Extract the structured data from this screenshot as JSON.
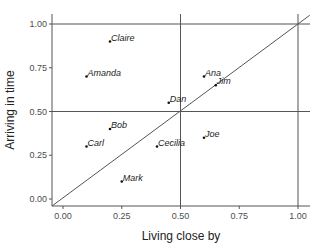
{
  "chart_data": {
    "type": "scatter",
    "title": "",
    "xlabel": "Living close by",
    "ylabel": "Arriving in time",
    "xlim": [
      -0.05,
      1.05
    ],
    "ylim": [
      -0.04,
      1.05
    ],
    "xticks": [
      "0.00",
      "0.25",
      "0.50",
      "0.75",
      "1.00"
    ],
    "yticks": [
      "0.00",
      "0.25",
      "0.50",
      "0.75",
      "1.00"
    ],
    "grid": false,
    "reference_lines": {
      "horizontal": [
        0.5,
        1.0
      ],
      "vertical": [
        0.5,
        1.0
      ],
      "diagonal": "y = x"
    },
    "points": [
      {
        "label": "Claire",
        "x": 0.2,
        "y": 0.9
      },
      {
        "label": "Amanda",
        "x": 0.1,
        "y": 0.7
      },
      {
        "label": "Ana",
        "x": 0.6,
        "y": 0.7
      },
      {
        "label": "Jim",
        "x": 0.65,
        "y": 0.65
      },
      {
        "label": "Dan",
        "x": 0.45,
        "y": 0.55
      },
      {
        "label": "Bob",
        "x": 0.2,
        "y": 0.4
      },
      {
        "label": "Carl",
        "x": 0.1,
        "y": 0.3
      },
      {
        "label": "Cecilia",
        "x": 0.4,
        "y": 0.3
      },
      {
        "label": "Joe",
        "x": 0.6,
        "y": 0.35
      },
      {
        "label": "Mark",
        "x": 0.25,
        "y": 0.1
      }
    ]
  }
}
